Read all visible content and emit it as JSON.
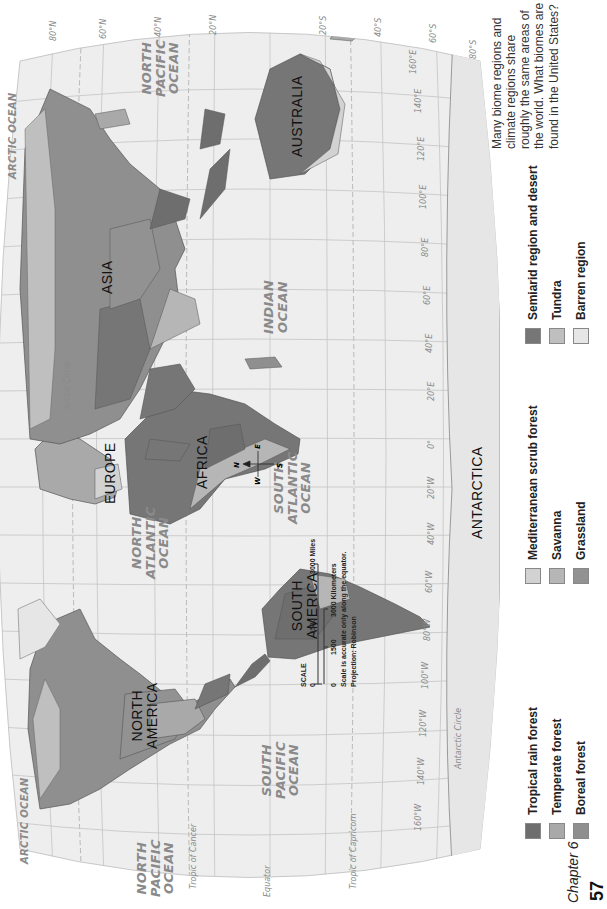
{
  "map": {
    "oceans": [
      {
        "id": "north-pacific-west",
        "text": "NORTH\nPACIFIC\nOCEAN"
      },
      {
        "id": "arctic-west",
        "text": "ARCTIC OCEAN"
      },
      {
        "id": "north-atlantic",
        "text": "NORTH\nATLANTIC\nOCEAN"
      },
      {
        "id": "south-pacific",
        "text": "SOUTH\nPACIFIC\nOCEAN"
      },
      {
        "id": "south-atlantic",
        "text": "SOUTH\nATLANTIC\nOCEAN"
      },
      {
        "id": "arctic-east",
        "text": "ARCTIC OCEAN"
      },
      {
        "id": "indian",
        "text": "INDIAN\nOCEAN"
      },
      {
        "id": "north-pacific-east",
        "text": "NORTH\nPACIFIC\nOCEAN"
      }
    ],
    "continents": {
      "north_america": "NORTH\nAMERICA",
      "south_america": "SOUTH\nAMERICA",
      "europe": "EUROPE",
      "africa": "AFRICA",
      "asia": "ASIA",
      "australia": "AUSTRALIA",
      "antarctica": "ANTARCTICA"
    },
    "lines": {
      "tropic_cancer": "Tropic of Cancer",
      "tropic_capricorn": "Tropic of Capricorn",
      "equator": "Equator",
      "arctic_circle": "Arctic Circle",
      "antarctic_circle": "Antarctic Circle"
    },
    "longitudes": [
      "160°W",
      "140°W",
      "120°W",
      "100°W",
      "80°W",
      "60°W",
      "40°W",
      "20°W",
      "0°",
      "20°E",
      "40°E",
      "60°E",
      "80°E",
      "100°E",
      "120°E",
      "140°E",
      "160°E"
    ],
    "latitudes": [
      "80°N",
      "60°N",
      "40°N",
      "20°N",
      "20°S",
      "40°S",
      "60°S",
      "80°S"
    ],
    "compass": {
      "n": "N",
      "s": "S",
      "e": "E",
      "w": "W"
    },
    "scale": {
      "title": "SCALE",
      "miles_ticks": [
        "0",
        "1500",
        "3000 Miles"
      ],
      "km_ticks": [
        "0",
        "1500",
        "3000 Kilometers"
      ],
      "note": "Scale is accurate only along the equator.",
      "projection": "Projection: Robinson"
    },
    "colors": {
      "ocean": "#eeeeee",
      "border": "#555555",
      "grid": "#bdbdbd"
    }
  },
  "legend": {
    "items": [
      {
        "label": "Tropical rain forest",
        "color": "#6e6e6e"
      },
      {
        "label": "Temperate forest",
        "color": "#a9a9a9"
      },
      {
        "label": "Boreal forest",
        "color": "#8f8f8f"
      },
      {
        "label": "Mediterranean scrub forest",
        "color": "#d2d2d2"
      },
      {
        "label": "Savanna",
        "color": "#b6b6b6"
      },
      {
        "label": "Grassland",
        "color": "#929292"
      },
      {
        "label": "Semiarid region and desert",
        "color": "#767676"
      },
      {
        "label": "Tundra",
        "color": "#bfbfbf"
      },
      {
        "label": "Barren region",
        "color": "#e6e6e6"
      }
    ]
  },
  "caption": "Many biome regions and climate regions share roughly the same areas of the world. What biomes are found in the United States?",
  "footer": {
    "chapter": "Chapter 6",
    "page": "57"
  }
}
